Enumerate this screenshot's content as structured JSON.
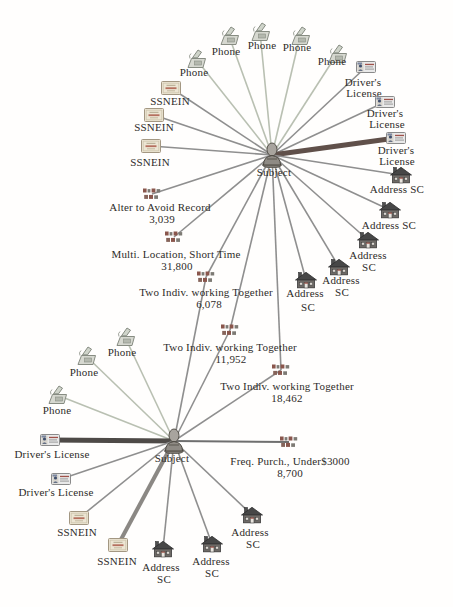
{
  "diagram": {
    "colors": {
      "phone": "#b9c0b2",
      "default": "#8f8f8f",
      "maroon": "#60504a",
      "dark": "#4e4a47",
      "thickgray": "#8b8884",
      "medium": "#6f6f6f",
      "label": "#2e2c29"
    },
    "nodes": [
      {
        "id": "T",
        "type": "subject",
        "icon_x": 272,
        "icon_y": 155,
        "label_lines": [
          {
            "text": "Subject",
            "x": 274,
            "y": 172
          }
        ]
      },
      {
        "id": "P1",
        "type": "phone",
        "icon_x": 196,
        "icon_y": 59,
        "label_lines": [
          {
            "text": "Phone",
            "x": 194,
            "y": 72
          }
        ]
      },
      {
        "id": "P2",
        "type": "phone",
        "icon_x": 229,
        "icon_y": 36,
        "label_lines": [
          {
            "text": "Phone",
            "x": 226,
            "y": 51
          }
        ]
      },
      {
        "id": "P3",
        "type": "phone",
        "icon_x": 260,
        "icon_y": 32,
        "label_lines": [
          {
            "text": "Phone",
            "x": 262,
            "y": 45
          }
        ]
      },
      {
        "id": "P4",
        "type": "phone",
        "icon_x": 300,
        "icon_y": 36,
        "label_lines": [
          {
            "text": "Phone",
            "x": 297,
            "y": 47
          }
        ]
      },
      {
        "id": "P5",
        "type": "phone",
        "icon_x": 337,
        "icon_y": 54,
        "label_lines": [
          {
            "text": "Phone",
            "x": 332,
            "y": 61
          }
        ]
      },
      {
        "id": "S1",
        "type": "ssnein",
        "icon_x": 171,
        "icon_y": 88,
        "label_lines": [
          {
            "text": "SSNEIN",
            "x": 170,
            "y": 101
          }
        ]
      },
      {
        "id": "S2",
        "type": "ssnein",
        "icon_x": 154,
        "icon_y": 115,
        "label_lines": [
          {
            "text": "SSNEIN",
            "x": 154,
            "y": 127
          }
        ]
      },
      {
        "id": "S3",
        "type": "ssnein",
        "icon_x": 151,
        "icon_y": 146,
        "label_lines": [
          {
            "text": "SSNEIN",
            "x": 150,
            "y": 162
          }
        ]
      },
      {
        "id": "D1",
        "type": "license",
        "icon_x": 366,
        "icon_y": 67,
        "label_lines": [
          {
            "text": "Driver's",
            "x": 363,
            "y": 82
          },
          {
            "text": "License",
            "x": 364,
            "y": 93
          }
        ]
      },
      {
        "id": "D2",
        "type": "license",
        "icon_x": 385,
        "icon_y": 102,
        "label_lines": [
          {
            "text": "Driver's",
            "x": 385,
            "y": 113
          },
          {
            "text": "License",
            "x": 387,
            "y": 124
          }
        ]
      },
      {
        "id": "D3",
        "type": "license",
        "icon_x": 396,
        "icon_y": 138,
        "label_lines": [
          {
            "text": "Driver's",
            "x": 396,
            "y": 150
          },
          {
            "text": "License",
            "x": 397,
            "y": 161
          }
        ]
      },
      {
        "id": "A1",
        "type": "address",
        "icon_x": 401,
        "icon_y": 175,
        "label_lines": [
          {
            "text": "Address SC",
            "x": 397,
            "y": 189
          }
        ]
      },
      {
        "id": "A2",
        "type": "address",
        "icon_x": 390,
        "icon_y": 210,
        "label_lines": [
          {
            "text": "Address SC",
            "x": 389,
            "y": 225
          }
        ]
      },
      {
        "id": "A3",
        "type": "address",
        "icon_x": 368,
        "icon_y": 240,
        "label_lines": [
          {
            "text": "Address",
            "x": 368,
            "y": 255
          },
          {
            "text": "SC",
            "x": 369,
            "y": 267
          }
        ]
      },
      {
        "id": "A4",
        "type": "address",
        "icon_x": 339,
        "icon_y": 267,
        "label_lines": [
          {
            "text": "Address",
            "x": 341,
            "y": 280
          },
          {
            "text": "SC",
            "x": 342,
            "y": 292
          }
        ]
      },
      {
        "id": "A5",
        "type": "address",
        "icon_x": 306,
        "icon_y": 280,
        "label_lines": [
          {
            "text": "Address",
            "x": 305,
            "y": 293
          },
          {
            "text": "SC",
            "x": 308,
            "y": 307
          }
        ]
      },
      {
        "id": "L1",
        "type": "event",
        "icon_x": 152,
        "icon_y": 194,
        "label_lines": [
          {
            "text": "Alter to Avoid Record",
            "x": 160,
            "y": 207
          },
          {
            "text": "3,039",
            "x": 162,
            "y": 219
          }
        ]
      },
      {
        "id": "L2",
        "type": "event",
        "icon_x": 174,
        "icon_y": 237,
        "label_lines": [
          {
            "text": "Multi. Location, Short Time",
            "x": 176,
            "y": 254
          },
          {
            "text": "31,800",
            "x": 177,
            "y": 266
          }
        ]
      },
      {
        "id": "L3",
        "type": "event",
        "icon_x": 206,
        "icon_y": 277,
        "label_lines": [
          {
            "text": "Two Indiv. working Together",
            "x": 206,
            "y": 292
          },
          {
            "text": "6,078",
            "x": 209,
            "y": 304
          }
        ]
      },
      {
        "id": "L4",
        "type": "event",
        "icon_x": 230,
        "icon_y": 330,
        "label_lines": [
          {
            "text": "Two Indiv. working Together",
            "x": 230,
            "y": 347
          },
          {
            "text": "11,952",
            "x": 231,
            "y": 359
          }
        ]
      },
      {
        "id": "L5",
        "type": "event",
        "icon_x": 281,
        "icon_y": 370,
        "label_lines": [
          {
            "text": "Two Indiv. working Together",
            "x": 287,
            "y": 386
          },
          {
            "text": "18,462",
            "x": 287,
            "y": 398
          }
        ]
      },
      {
        "id": "B",
        "type": "subject",
        "icon_x": 174,
        "icon_y": 441,
        "label_lines": [
          {
            "text": "Subject",
            "x": 172,
            "y": 458
          }
        ]
      },
      {
        "id": "BP1",
        "type": "phone",
        "icon_x": 125,
        "icon_y": 337,
        "label_lines": [
          {
            "text": "Phone",
            "x": 122,
            "y": 352
          }
        ]
      },
      {
        "id": "BP2",
        "type": "phone",
        "icon_x": 86,
        "icon_y": 356,
        "label_lines": [
          {
            "text": "Phone",
            "x": 84,
            "y": 372
          }
        ]
      },
      {
        "id": "BP3",
        "type": "phone",
        "icon_x": 57,
        "icon_y": 395,
        "label_lines": [
          {
            "text": "Phone",
            "x": 57,
            "y": 410
          }
        ]
      },
      {
        "id": "BD1",
        "type": "license",
        "icon_x": 50,
        "icon_y": 440,
        "label_lines": [
          {
            "text": "Driver's License",
            "x": 52,
            "y": 454
          }
        ]
      },
      {
        "id": "BD2",
        "type": "license",
        "icon_x": 61,
        "icon_y": 479,
        "label_lines": [
          {
            "text": "Driver's License",
            "x": 56,
            "y": 492
          }
        ]
      },
      {
        "id": "BS1",
        "type": "ssnein",
        "icon_x": 79,
        "icon_y": 518,
        "label_lines": [
          {
            "text": "SSNEIN",
            "x": 77,
            "y": 532
          }
        ]
      },
      {
        "id": "BS2",
        "type": "ssnein",
        "icon_x": 118,
        "icon_y": 545,
        "label_lines": [
          {
            "text": "SSNEIN",
            "x": 117,
            "y": 561
          }
        ]
      },
      {
        "id": "BA1",
        "type": "address",
        "icon_x": 163,
        "icon_y": 549,
        "label_lines": [
          {
            "text": "Address",
            "x": 161,
            "y": 567
          },
          {
            "text": "SC",
            "x": 164,
            "y": 579
          }
        ]
      },
      {
        "id": "BA2",
        "type": "address",
        "icon_x": 212,
        "icon_y": 544,
        "label_lines": [
          {
            "text": "Address",
            "x": 211,
            "y": 561
          },
          {
            "text": "SC",
            "x": 212,
            "y": 573
          }
        ]
      },
      {
        "id": "BA3",
        "type": "address",
        "icon_x": 252,
        "icon_y": 515,
        "label_lines": [
          {
            "text": "Address",
            "x": 250,
            "y": 532
          },
          {
            "text": "SC",
            "x": 253,
            "y": 544
          }
        ]
      },
      {
        "id": "BL1",
        "type": "event",
        "icon_x": 289,
        "icon_y": 442,
        "label_lines": [
          {
            "text": "Freq. Purch., Under$3000",
            "x": 290,
            "y": 461
          },
          {
            "text": "8,700",
            "x": 290,
            "y": 473
          }
        ]
      }
    ],
    "edges": [
      {
        "from": "T",
        "to": "P1",
        "color": "phone",
        "width": 1.6
      },
      {
        "from": "T",
        "to": "P2",
        "color": "phone",
        "width": 1.6
      },
      {
        "from": "T",
        "to": "P3",
        "color": "phone",
        "width": 1.6
      },
      {
        "from": "T",
        "to": "P4",
        "color": "phone",
        "width": 1.6
      },
      {
        "from": "T",
        "to": "P5",
        "color": "phone",
        "width": 1.6
      },
      {
        "from": "T",
        "to": "S1",
        "color": "default",
        "width": 1.6
      },
      {
        "from": "T",
        "to": "S2",
        "color": "default",
        "width": 1.6
      },
      {
        "from": "T",
        "to": "S3",
        "color": "default",
        "width": 1.6
      },
      {
        "from": "T",
        "to": "D1",
        "color": "default",
        "width": 1.6
      },
      {
        "from": "T",
        "to": "D2",
        "color": "default",
        "width": 1.6
      },
      {
        "from": "T",
        "to": "D3",
        "color": "maroon",
        "width": 5
      },
      {
        "from": "T",
        "to": "A1",
        "color": "default",
        "width": 1.6
      },
      {
        "from": "T",
        "to": "A2",
        "color": "default",
        "width": 1.6
      },
      {
        "from": "T",
        "to": "A3",
        "color": "default",
        "width": 1.6
      },
      {
        "from": "T",
        "to": "A4",
        "color": "default",
        "width": 1.6
      },
      {
        "from": "T",
        "to": "A5",
        "color": "default",
        "width": 1.6
      },
      {
        "from": "T",
        "to": "L1",
        "color": "default",
        "width": 1.6
      },
      {
        "from": "T",
        "to": "L2",
        "color": "default",
        "width": 1.6
      },
      {
        "from": "T",
        "to": "L3",
        "color": "default",
        "width": 1.6
      },
      {
        "from": "T",
        "to": "L4",
        "color": "default",
        "width": 1.6
      },
      {
        "from": "T",
        "to": "L5",
        "color": "default",
        "width": 1.6
      },
      {
        "from": "L3",
        "to": "B",
        "color": "default",
        "width": 1.6
      },
      {
        "from": "L4",
        "to": "B",
        "color": "default",
        "width": 1.6
      },
      {
        "from": "L5",
        "to": "B",
        "color": "default",
        "width": 1.6
      },
      {
        "from": "B",
        "to": "BP1",
        "color": "phone",
        "width": 1.6
      },
      {
        "from": "B",
        "to": "BP2",
        "color": "phone",
        "width": 1.6
      },
      {
        "from": "B",
        "to": "BP3",
        "color": "phone",
        "width": 1.6
      },
      {
        "from": "B",
        "to": "BD1",
        "color": "dark",
        "width": 5
      },
      {
        "from": "B",
        "to": "BD2",
        "color": "default",
        "width": 1.6
      },
      {
        "from": "B",
        "to": "BS1",
        "color": "default",
        "width": 1.6
      },
      {
        "from": "B",
        "to": "BS2",
        "color": "thickgray",
        "width": 4
      },
      {
        "from": "B",
        "to": "BA1",
        "color": "default",
        "width": 1.6
      },
      {
        "from": "B",
        "to": "BA2",
        "color": "default",
        "width": 1.6
      },
      {
        "from": "B",
        "to": "BA3",
        "color": "default",
        "width": 1.6
      },
      {
        "from": "B",
        "to": "BL1",
        "color": "medium",
        "width": 2
      }
    ]
  }
}
